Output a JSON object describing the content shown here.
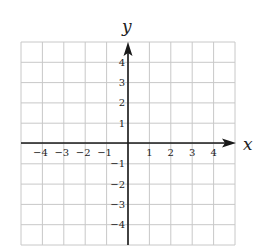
{
  "diagram": {
    "type": "coordinate-grid",
    "axis_labels": {
      "x": "x",
      "y": "y"
    },
    "x_range": [
      -5,
      5
    ],
    "y_range": [
      -5,
      5
    ],
    "grid_cells": {
      "columns": 10,
      "rows": 10
    },
    "x_ticks": [
      {
        "value": -4,
        "label": "−4"
      },
      {
        "value": -3,
        "label": "−3"
      },
      {
        "value": -2,
        "label": "−2"
      },
      {
        "value": -1,
        "label": "−1"
      },
      {
        "value": 1,
        "label": "1"
      },
      {
        "value": 2,
        "label": "2"
      },
      {
        "value": 3,
        "label": "3"
      },
      {
        "value": 4,
        "label": "4"
      }
    ],
    "y_ticks": [
      {
        "value": 4,
        "label": "4"
      },
      {
        "value": 3,
        "label": "3"
      },
      {
        "value": 2,
        "label": "2"
      },
      {
        "value": 1,
        "label": "1"
      },
      {
        "value": -1,
        "label": "−1"
      },
      {
        "value": -2,
        "label": "−2"
      },
      {
        "value": -3,
        "label": "−3"
      },
      {
        "value": -4,
        "label": "−4"
      }
    ],
    "colors": {
      "grid": "#c8c8c8",
      "axes": "#1a1a1a",
      "text": "#222222"
    }
  }
}
